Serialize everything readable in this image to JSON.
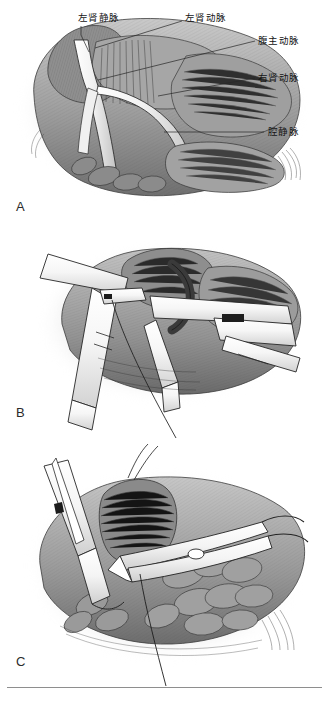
{
  "figure": {
    "style": "grayscale pen-and-ink medical illustration",
    "panel_count": 3
  },
  "panels": [
    {
      "id": "A",
      "letter": "A",
      "description": "暴露的肾血管与腹主动脉解剖图",
      "labels": [
        {
          "id": "left-renal-vein",
          "text": "左肾静脉",
          "pinyin": "zuo shen jing mai",
          "english": "Left renal vein",
          "x": 78,
          "y": 13,
          "leader": {
            "x1": 81,
            "y1": 27,
            "x2": 81,
            "y2": 34,
            "x3": 88,
            "y3": 52
          }
        },
        {
          "id": "left-renal-artery",
          "text": "左肾动脉",
          "pinyin": "zuo shen dong mai",
          "english": "Left renal artery",
          "x": 185,
          "y": 13,
          "leader": {
            "x1": 182,
            "y1": 22,
            "x2": 95,
            "y2": 47
          }
        },
        {
          "id": "abdominal-aorta",
          "text": "腹主动脉",
          "pinyin": "fu zhu dong mai",
          "english": "Abdominal aorta",
          "x": 258,
          "y": 37,
          "leader": {
            "x1": 255,
            "y1": 42,
            "x2": 97,
            "y2": 80
          }
        },
        {
          "id": "right-renal-artery",
          "text": "右肾动脉",
          "pinyin": "you shen dong mai",
          "english": "Right renal artery",
          "x": 258,
          "y": 74,
          "leader": {
            "x1": 255,
            "y1": 79,
            "x2": 160,
            "y2": 95
          }
        },
        {
          "id": "vena-cava",
          "text": "腔静脉",
          "pinyin": "qiang jing mai",
          "english": "Vena cava",
          "x": 268,
          "y": 128,
          "leader": {
            "x1": 264,
            "y1": 133,
            "x2": 165,
            "y2": 133
          }
        }
      ]
    },
    {
      "id": "B",
      "letter": "B",
      "description": "血管夹阻断肾动脉与肾静脉",
      "labels": []
    },
    {
      "id": "C",
      "letter": "C",
      "description": "剪开血管并缝合操作",
      "labels": []
    }
  ],
  "panel_letters": {
    "a": {
      "label": "A",
      "x": 16,
      "y": 200
    },
    "b": {
      "label": "B",
      "x": 16,
      "y": 406
    },
    "c": {
      "label": "C",
      "x": 16,
      "y": 655
    }
  },
  "colors": {
    "page_background": "#ffffff",
    "ink": "#1a1a1a",
    "leader_line": "#262626",
    "footer_rule": "#8e8e8e",
    "tissue_mid": "#9a9a9a",
    "tissue_dark": "#4a4a4a",
    "tissue_light": "#d6d6d6",
    "instrument_fill": "#fafafa",
    "instrument_edge": "#2a2a2a",
    "vignette": "#b8b8b8"
  },
  "footer": {
    "rule_visible": true
  }
}
